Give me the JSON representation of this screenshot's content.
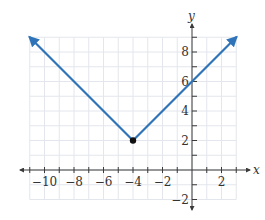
{
  "chart_data": {
    "type": "line",
    "title": "",
    "function": "y = |x + 4| + 2",
    "xlabel": "x",
    "ylabel": "y",
    "xlim": [
      -11,
      3
    ],
    "ylim": [
      -2,
      9
    ],
    "grid": true,
    "x_ticks": [
      -10,
      -8,
      -6,
      -4,
      -2,
      2
    ],
    "x_tick_labels": [
      "−10",
      "−8",
      "−6",
      "−4",
      "−2",
      "2"
    ],
    "y_ticks": [
      -2,
      2,
      4,
      6,
      8
    ],
    "y_tick_labels": [
      "−2",
      "2",
      "4",
      "6",
      "8"
    ],
    "series": [
      {
        "name": "absolute value function",
        "x": [
          -11,
          -4,
          3
        ],
        "y": [
          9,
          2,
          9
        ],
        "color": "#2f74b8",
        "arrows_at_ends": true
      }
    ],
    "points": [
      {
        "label": "vertex",
        "x": -4,
        "y": 2,
        "color": "#111111"
      }
    ],
    "annotations": []
  },
  "labels": {
    "x_axis": "x",
    "y_axis": "y"
  }
}
